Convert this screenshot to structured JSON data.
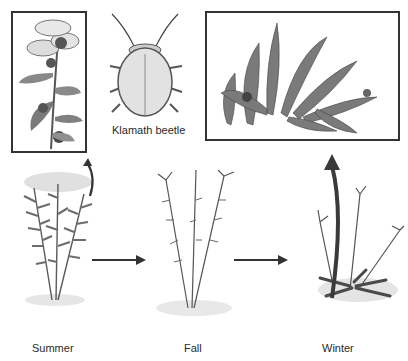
{
  "figure": {
    "insets": {
      "flower": {
        "description": "Flowering stem with beetles (inset)"
      },
      "beetle": {
        "label": "Klamath beetle"
      },
      "rosette": {
        "description": "Basal rosette with beetle (inset)"
      }
    },
    "stages": [
      {
        "label": "Summer"
      },
      {
        "label": "Fall"
      },
      {
        "label": "Winter"
      }
    ],
    "arrows": [
      {
        "from": "Summer",
        "to": "Fall",
        "type": "straight"
      },
      {
        "from": "Fall",
        "to": "Winter",
        "type": "straight"
      },
      {
        "from": "Summer",
        "to": "flower inset",
        "type": "curved"
      },
      {
        "from": "Winter",
        "to": "rosette inset",
        "type": "curved"
      }
    ],
    "colors": {
      "ink": "#333333",
      "foliage": "#6a6a6a",
      "background": "#ffffff"
    }
  }
}
